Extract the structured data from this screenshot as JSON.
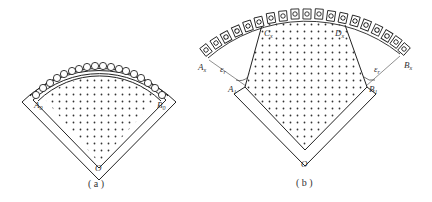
{
  "figure": {
    "panels": [
      {
        "id": "a",
        "caption": "( a )",
        "labels": {
          "left": "A",
          "left_sub": "0",
          "right": "B",
          "right_sub": "0",
          "apex": "O"
        },
        "coil_count": 19
      },
      {
        "id": "b",
        "caption": "( b )",
        "labels": {
          "outer_left": "A",
          "outer_left_sub": "x",
          "inner_left": "A",
          "inner_left_sub": "1",
          "outer_right": "B",
          "outer_right_sub": "x",
          "inner_right": "B",
          "inner_right_sub": "1",
          "top_left": "C",
          "top_left_sub": "x",
          "top_right": "D",
          "top_right_sub": "x",
          "angle_left": "ε",
          "angle_left_sub": "r",
          "angle_right": "ε",
          "angle_right_sub": "r",
          "apex": "O"
        },
        "coil_count": 19
      }
    ],
    "colors": {
      "stroke": "#222222",
      "dots": "#333333",
      "label": "#333333",
      "background": "#ffffff"
    }
  }
}
